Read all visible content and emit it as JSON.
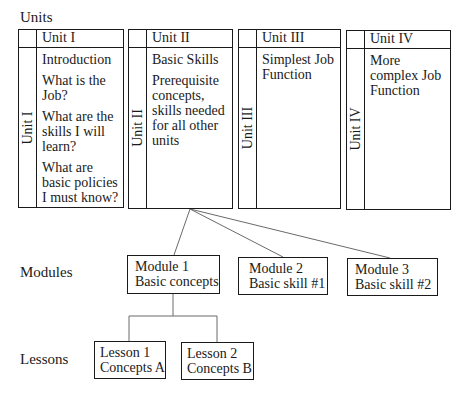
{
  "labels": {
    "units": "Units",
    "modules": "Modules",
    "lessons": "Lessons"
  },
  "units": [
    {
      "header": "Unit I",
      "side_label": "Unit I",
      "lines": [
        "Introduction",
        "What is the Job?",
        "What are the skills I will learn?",
        "What are basic policies I must know?"
      ]
    },
    {
      "header": "Unit II",
      "side_label": "Unit II",
      "lines": [
        "Basic Skills",
        "Prerequisite concepts, skills needed for all other units"
      ]
    },
    {
      "header": "Unit III",
      "side_label": "Unit III",
      "lines": [
        "Simplest Job Function"
      ]
    },
    {
      "header": "Unit IV",
      "side_label": "Unit IV",
      "lines": [
        "More complex Job Function"
      ]
    }
  ],
  "modules": [
    {
      "title": "Module 1",
      "subtitle": "Basic concepts"
    },
    {
      "title": "Module 2",
      "subtitle": "Basic skill #1"
    },
    {
      "title": "Module 3",
      "subtitle": "Basic skill #2"
    }
  ],
  "lessons": [
    {
      "title": "Lesson 1",
      "subtitle": "Concepts A"
    },
    {
      "title": "Lesson 2",
      "subtitle": "Concepts B"
    }
  ],
  "colors": {
    "line": "#1a1a1a",
    "connector": "#6a6a6a",
    "background": "#ffffff"
  }
}
